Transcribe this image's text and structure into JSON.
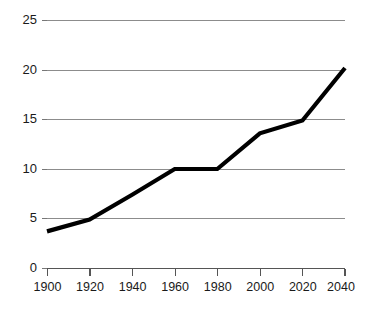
{
  "chart_data": {
    "type": "line",
    "title": "",
    "subtitle": "",
    "xlabel": "",
    "ylabel": "",
    "x": [
      1900,
      1920,
      1940,
      1960,
      1980,
      2000,
      2020,
      2040
    ],
    "values": [
      3.7,
      4.9,
      7.4,
      10.0,
      10.0,
      13.6,
      14.9,
      20.2
    ],
    "series": [
      {
        "name": "",
        "values": [
          3.7,
          4.9,
          7.4,
          10.0,
          10.0,
          13.6,
          14.9,
          20.2
        ]
      }
    ],
    "xticks": [
      "1900",
      "1920",
      "1940",
      "1960",
      "1980",
      "2000",
      "2020",
      "2040"
    ],
    "yticks": [
      "0",
      "5",
      "10",
      "15",
      "20",
      "25"
    ],
    "ytick_values": [
      0,
      5,
      10,
      15,
      20,
      25
    ],
    "xlim": [
      1900,
      2040
    ],
    "ylim": [
      0,
      25
    ],
    "grid": "horizontal",
    "legend": "none",
    "line_color": "#000000",
    "grid_color": "#8c8c8c",
    "axis_color": "#555555",
    "background_color": "#ffffff",
    "annotations": []
  }
}
